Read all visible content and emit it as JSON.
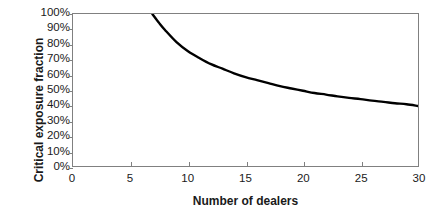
{
  "chart_data": {
    "type": "line",
    "title": "",
    "subtitle": "",
    "xlabel": "Number of dealers",
    "ylabel": "Critical exposure fraction",
    "xlim": [
      0,
      30
    ],
    "ylim": [
      0,
      100
    ],
    "grid": false,
    "legend": null,
    "annotations": [],
    "x_ticks": [
      0,
      5,
      10,
      15,
      20,
      25,
      30
    ],
    "x_tick_labels": [
      "0",
      "5",
      "10",
      "15",
      "20",
      "25",
      "30"
    ],
    "y_ticks": [
      0,
      10,
      20,
      30,
      40,
      50,
      60,
      70,
      80,
      90,
      100
    ],
    "y_tick_labels": [
      "0%",
      "10%",
      "20%",
      "30%",
      "40%",
      "50%",
      "60%",
      "70%",
      "80%",
      "90%",
      "100%"
    ],
    "series": [
      {
        "name": "Critical exposure fraction",
        "color": "#000000",
        "line_width": 2.4,
        "x": [
          6.9,
          7.5,
          8,
          9,
          10,
          11,
          12,
          13,
          14,
          15,
          16,
          17,
          18,
          19,
          20,
          21,
          22,
          23,
          24,
          25,
          26,
          27,
          28,
          29,
          30
        ],
        "y": [
          100,
          94,
          89.5,
          81.5,
          75.5,
          71,
          67,
          64,
          61,
          58.5,
          56.5,
          54.5,
          52.5,
          51,
          49.5,
          48,
          47,
          45.8,
          44.8,
          44,
          43,
          42.2,
          41.3,
          40.6,
          39.5
        ]
      }
    ]
  },
  "axis_color": "#808080",
  "text_color": "#1a1a1a",
  "background": "#ffffff"
}
